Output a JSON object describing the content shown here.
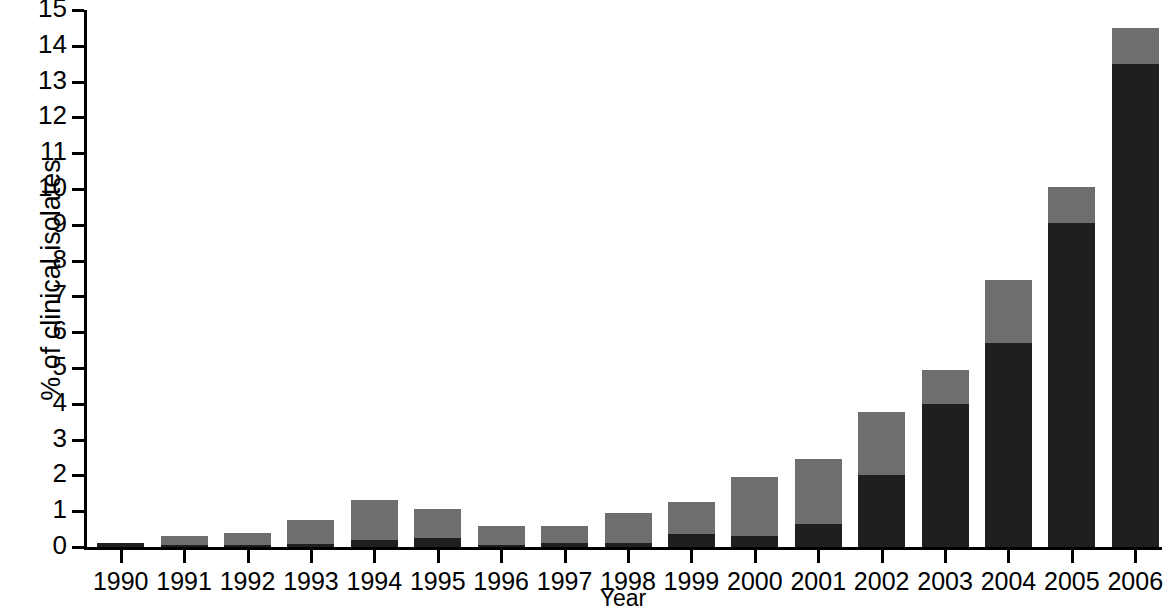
{
  "chart_data": {
    "type": "bar",
    "stacked": true,
    "title": "",
    "xlabel": "Year",
    "ylabel": "% of clinical isolates",
    "categories": [
      "1990",
      "1991",
      "1992",
      "1993",
      "1994",
      "1995",
      "1996",
      "1997",
      "1998",
      "1999",
      "2000",
      "2001",
      "2002",
      "2003",
      "2004",
      "2005",
      "2006"
    ],
    "ylim": [
      0,
      15
    ],
    "yticks": [
      0,
      1,
      2,
      3,
      4,
      5,
      6,
      7,
      8,
      9,
      10,
      11,
      12,
      13,
      14,
      15
    ],
    "ytick_labels": [
      "0",
      "1",
      "2",
      "3",
      "4",
      "5",
      "6",
      "7",
      "8",
      "9",
      "10",
      "11",
      "12",
      "13",
      "14",
      "15"
    ],
    "grid": false,
    "legend": "none",
    "series": [
      {
        "name": "dark-segment",
        "color": "#1f1f1f",
        "values": [
          0.1,
          0.05,
          0.05,
          0.08,
          0.2,
          0.25,
          0.05,
          0.1,
          0.1,
          0.35,
          0.3,
          0.65,
          2.0,
          4.0,
          5.7,
          9.05,
          13.5
        ]
      },
      {
        "name": "gray-segment",
        "color": "#6e6e6e",
        "values": [
          0.0,
          0.25,
          0.35,
          0.67,
          1.1,
          0.8,
          0.55,
          0.5,
          0.85,
          0.9,
          1.65,
          1.8,
          1.77,
          0.95,
          1.75,
          1.0,
          1.0
        ]
      }
    ],
    "totals": [
      0.1,
      0.3,
      0.4,
      0.75,
      1.3,
      1.05,
      0.6,
      0.6,
      0.95,
      1.25,
      1.95,
      2.45,
      3.77,
      4.95,
      7.45,
      10.05,
      14.5
    ]
  },
  "colors": {
    "dark": "#1f1f1f",
    "gray": "#6e6e6e",
    "axis": "#000000",
    "background": "#ffffff"
  }
}
